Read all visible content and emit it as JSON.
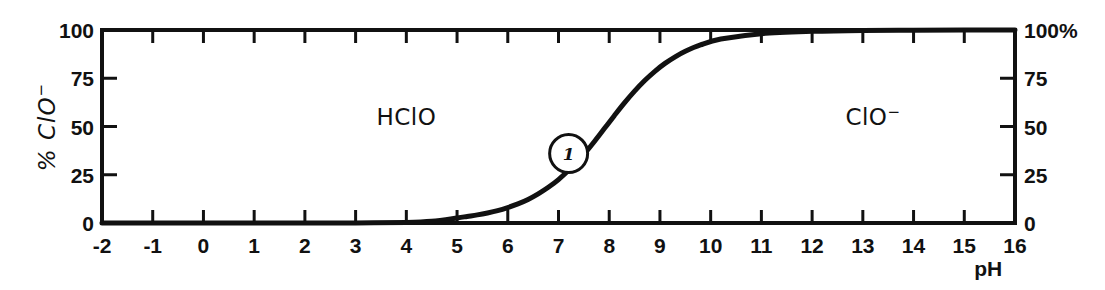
{
  "chart_data": {
    "type": "line",
    "title": "",
    "subtitle": "",
    "xlabel": "pH",
    "ylabel": "% ClO-",
    "ylabel_display": "% ClO",
    "ylabel_superscript": "−",
    "right_axis_label": "%",
    "xlim": [
      -2,
      16
    ],
    "ylim": [
      0,
      100
    ],
    "grid": false,
    "legend_position": "none",
    "x_ticks": [
      -2,
      -1,
      0,
      1,
      2,
      3,
      4,
      5,
      6,
      7,
      8,
      9,
      10,
      11,
      12,
      13,
      14,
      15,
      16
    ],
    "x_tick_labels": [
      "-2",
      "-1",
      "0",
      "1",
      "2",
      "3",
      "4",
      "5",
      "6",
      "7",
      "8",
      "9",
      "10",
      "11",
      "12",
      "13",
      "14",
      "15",
      "16"
    ],
    "y_ticks": [
      0,
      25,
      50,
      75,
      100
    ],
    "y_tick_labels_left": [
      "0",
      "25",
      "50",
      "75",
      "100"
    ],
    "y_tick_labels_right": [
      "0",
      "25",
      "50",
      "75",
      "100%"
    ],
    "series": [
      {
        "name": "% ClO-",
        "pKa": 7.53,
        "x": [
          -2,
          -1,
          0,
          1,
          2,
          3,
          4,
          4.5,
          5,
          5.2,
          5.4,
          5.6,
          5.8,
          6.0,
          6.2,
          6.4,
          6.6,
          6.8,
          7.0,
          7.2,
          7.4,
          7.53,
          7.7,
          7.9,
          8.1,
          8.3,
          8.5,
          8.7,
          8.9,
          9.1,
          9.3,
          9.5,
          9.8,
          10.2,
          11,
          12,
          13,
          14,
          15,
          16
        ],
        "y": [
          0,
          0,
          0,
          0,
          0,
          0,
          0.3,
          0.9,
          2.6,
          3.4,
          4.2,
          5.2,
          6.4,
          8.0,
          9.9,
          12.2,
          15.1,
          18.5,
          22.5,
          27.3,
          32.7,
          36.5,
          42.0,
          48.8,
          55.6,
          62.2,
          68.3,
          73.8,
          78.6,
          82.7,
          86.1,
          89.0,
          92.3,
          95.3,
          98.1,
          99.3,
          99.8,
          99.9,
          100,
          100
        ]
      }
    ],
    "annotations": [
      {
        "label": "HClO",
        "label_display": "HClO",
        "superscript": "",
        "x_pH": 4.0,
        "y_pct": 55,
        "kind": "region-label"
      },
      {
        "label": "ClO-",
        "label_display": "ClO",
        "superscript": "−",
        "x_pH": 13.2,
        "y_pct": 55,
        "kind": "region-label"
      },
      {
        "label": "1",
        "x_pH": 7.2,
        "y_pct": 36,
        "kind": "curve-marker"
      }
    ]
  },
  "axes": {
    "left_title": "% ClO",
    "left_title_superscript": "−",
    "bottom_title": "pH",
    "right_unit": "%"
  }
}
